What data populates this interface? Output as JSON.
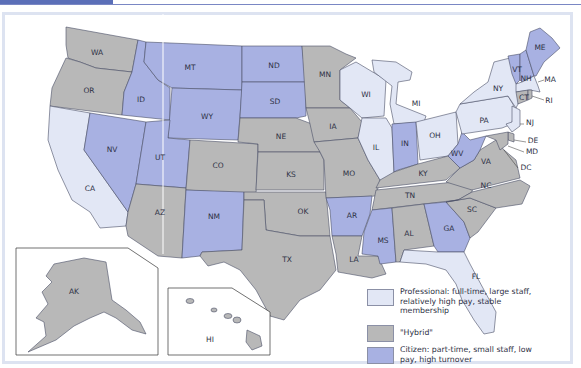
{
  "colors": {
    "professional": "#e2e7f5",
    "hybrid": "#b8b8b8",
    "citizen": "#a8b1e2",
    "header_accent": "#5b6fb8"
  },
  "legend": {
    "items": [
      {
        "key": "professional",
        "label": "Professional: full-time, large staff, relatively high pay, stable membership"
      },
      {
        "key": "hybrid",
        "label": "\"Hybrid\""
      },
      {
        "key": "citizen",
        "label": "Citizen: part-time, small staff, low pay, high turnover"
      }
    ]
  },
  "states": {
    "professional": [
      "CA",
      "WI",
      "MI",
      "IL",
      "OH",
      "NY",
      "PA",
      "NJ",
      "MA",
      "FL"
    ],
    "hybrid": [
      "WA",
      "OR",
      "AZ",
      "CO",
      "MN",
      "NE",
      "KS",
      "OK",
      "TX",
      "IA",
      "MO",
      "LA",
      "AL",
      "TN",
      "KY",
      "NC",
      "SC",
      "VA",
      "CT",
      "RI",
      "DE",
      "MD",
      "AK",
      "HI"
    ],
    "citizen": [
      "MT",
      "ID",
      "WY",
      "ND",
      "SD",
      "NV",
      "UT",
      "NM",
      "AR",
      "MS",
      "IN",
      "WV",
      "GA",
      "VT",
      "NH",
      "ME"
    ]
  },
  "labels": {
    "WA": "WA",
    "OR": "OR",
    "CA": "CA",
    "ID": "ID",
    "NV": "NV",
    "MT": "MT",
    "WY": "WY",
    "UT": "UT",
    "AZ": "AZ",
    "CO": "CO",
    "NM": "NM",
    "ND": "ND",
    "SD": "SD",
    "NE": "NE",
    "KS": "KS",
    "OK": "OK",
    "TX": "TX",
    "MN": "MN",
    "IA": "IA",
    "MO": "MO",
    "AR": "AR",
    "LA": "LA",
    "WI": "WI",
    "IL": "IL",
    "MI": "MI",
    "IN": "IN",
    "OH": "OH",
    "KY": "KY",
    "TN": "TN",
    "MS": "MS",
    "AL": "AL",
    "GA": "GA",
    "FL": "FL",
    "SC": "SC",
    "NC": "NC",
    "VA": "VA",
    "WV": "WV",
    "PA": "PA",
    "NY": "NY",
    "VT": "VT",
    "NH": "NH",
    "ME": "ME",
    "MA": "MA",
    "RI": "RI",
    "CT": "CT",
    "NJ": "NJ",
    "DE": "DE",
    "MD": "MD",
    "DC": "DC",
    "AK": "AK",
    "HI": "HI"
  }
}
